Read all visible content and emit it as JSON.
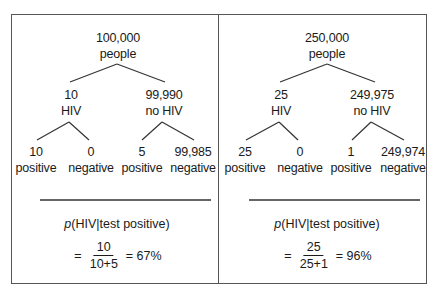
{
  "panels": [
    {
      "root": {
        "count": "100,000",
        "label": "people"
      },
      "branches": [
        {
          "count": "10",
          "label": "HIV",
          "leaves": [
            {
              "count": "10",
              "label": "positive"
            },
            {
              "count": "0",
              "label": "negative"
            }
          ]
        },
        {
          "count": "99,990",
          "label": "no HIV",
          "leaves": [
            {
              "count": "5",
              "label": "positive"
            },
            {
              "count": "99,985",
              "label": "negative"
            }
          ]
        }
      ],
      "formula": {
        "p": "p",
        "expr": "(HIV|test positive)",
        "equals": "=",
        "numerator": "10",
        "denominator": "10+5",
        "result": "= 67%"
      }
    },
    {
      "root": {
        "count": "250,000",
        "label": "people"
      },
      "branches": [
        {
          "count": "25",
          "label": "HIV",
          "leaves": [
            {
              "count": "25",
              "label": "positive"
            },
            {
              "count": "0",
              "label": "negative"
            }
          ]
        },
        {
          "count": "249,975",
          "label": "no HIV",
          "leaves": [
            {
              "count": "1",
              "label": "positive"
            },
            {
              "count": "249,974",
              "label": "negative"
            }
          ]
        }
      ],
      "formula": {
        "p": "p",
        "expr": "(HIV|test positive)",
        "equals": "=",
        "numerator": "25",
        "denominator": "25+1",
        "result": "= 96%"
      }
    }
  ],
  "colors": {
    "line": "#333333",
    "border": "#555555",
    "text": "#1a1a1a"
  }
}
